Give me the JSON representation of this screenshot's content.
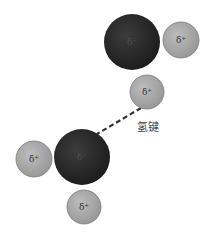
{
  "diagram": {
    "bond_label": "氢键",
    "colors": {
      "oxygen": "#2a2a2a",
      "hydrogen": "#a8a8a8",
      "hydrogen_stroke": "#7a7a7a",
      "bond_line": "#333333",
      "background": "#ffffff"
    },
    "molecules": [
      {
        "name": "water-molecule-top",
        "oxygen": {
          "label": "δ⁻",
          "cx": 132,
          "cy": 42,
          "r": 28
        },
        "hydrogens": [
          {
            "label": "δ⁺",
            "cx": 181,
            "cy": 40,
            "r": 18
          },
          {
            "label": "δ⁺",
            "cx": 147,
            "cy": 92,
            "r": 17
          }
        ]
      },
      {
        "name": "water-molecule-bottom",
        "oxygen": {
          "label": "δ⁻",
          "cx": 82,
          "cy": 157,
          "r": 28
        },
        "hydrogens": [
          {
            "label": "δ⁺",
            "cx": 34,
            "cy": 159,
            "r": 18
          },
          {
            "label": "δ⁺",
            "cx": 84,
            "cy": 207,
            "r": 17
          }
        ]
      }
    ],
    "hydrogen_bond": {
      "x1": 141,
      "y1": 108,
      "x2": 97,
      "y2": 134
    }
  }
}
